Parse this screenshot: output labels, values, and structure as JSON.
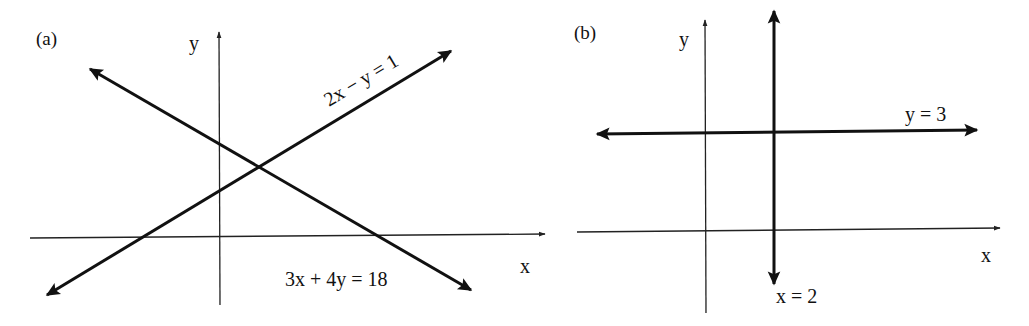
{
  "figure": {
    "panels": [
      {
        "id": "a",
        "label": "(a)",
        "axes": {
          "x_label": "x",
          "y_label": "y"
        },
        "lines": [
          {
            "equation": "2x − y = 1",
            "direction": "increasing"
          },
          {
            "equation": "3x + 4y = 18",
            "direction": "decreasing"
          }
        ]
      },
      {
        "id": "b",
        "label": "(b)",
        "axes": {
          "x_label": "x",
          "y_label": "y"
        },
        "lines": [
          {
            "equation": "y = 3",
            "direction": "horizontal"
          },
          {
            "equation": "x = 2",
            "direction": "vertical"
          }
        ]
      }
    ],
    "colors": {
      "ink": "#111111",
      "background": "#ffffff"
    }
  }
}
